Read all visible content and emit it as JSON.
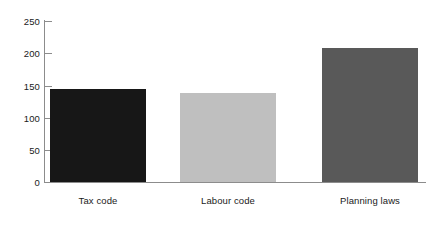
{
  "chart_data": {
    "type": "bar",
    "title": "",
    "subtitle": "",
    "xlabel": "",
    "ylabel": "",
    "categories": [
      "Tax code",
      "Labour code",
      "Planning laws"
    ],
    "values": [
      145,
      138,
      208
    ],
    "ylim": [
      0,
      250
    ],
    "yticks": [
      0,
      50,
      100,
      150,
      200,
      250
    ],
    "ytick_labels": [
      "0",
      "50",
      "100",
      "150",
      "200",
      "250"
    ],
    "grid": false,
    "legend": null,
    "bar_colors": [
      "#171717",
      "#bfbfbf",
      "#595959"
    ],
    "axis_color": "#8c8c8c",
    "text_color": "#1a1a1a",
    "background": "#ffffff"
  }
}
